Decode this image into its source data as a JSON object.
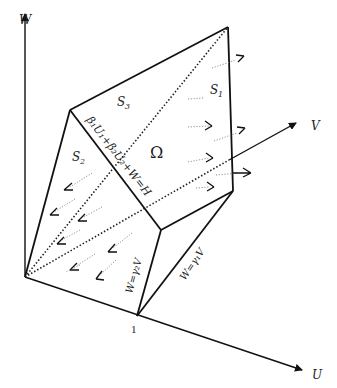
{
  "figure": {
    "axes": {
      "w_label": "W",
      "u_label": "U",
      "v_label": "V",
      "unit_tick_label": "1"
    },
    "regions": {
      "s1_label": "S",
      "s1_sub": "1",
      "s2_label": "S",
      "s2_sub": "2",
      "s3_label": "S",
      "s3_sub": "3",
      "omega_label": "Ω"
    },
    "equations": {
      "hyperplane": "β₁U₁+β₂U₂+W=H",
      "plane_gamma2": "W=γ₂V",
      "plane_gamma1": "W=γ₁V"
    },
    "colors": {
      "line": "#111111",
      "background": "#ffffff",
      "flow_dots": "#888888"
    }
  }
}
